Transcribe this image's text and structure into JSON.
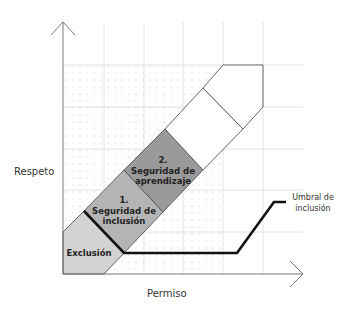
{
  "diagram": {
    "axes": {
      "x_label": "Permiso",
      "y_label": "Respeto"
    },
    "zones": [
      {
        "id": "exclusion",
        "label_lines": [
          "Exclusión"
        ],
        "color": "#d2d2d2"
      },
      {
        "id": "inclusion",
        "label_lines": [
          "1.",
          "Seguridad de",
          "inclusión"
        ],
        "color": "#b4b4b4"
      },
      {
        "id": "aprendizaje",
        "label_lines": [
          "2.",
          "Seguridad de",
          "aprendizaje"
        ],
        "color": "#9a9a9a"
      },
      {
        "id": "zone-3",
        "label_lines": [],
        "color": "#ffffff"
      },
      {
        "id": "zone-4",
        "label_lines": [],
        "color": "#ffffff"
      }
    ],
    "threshold": {
      "label_lines": [
        "Umbral de",
        "inclusión"
      ],
      "color": "#111111"
    },
    "colors": {
      "grid": "#d8d8d8",
      "axis": "#777777",
      "band_outline": "#555555",
      "dots": "#c4c4c4"
    }
  }
}
